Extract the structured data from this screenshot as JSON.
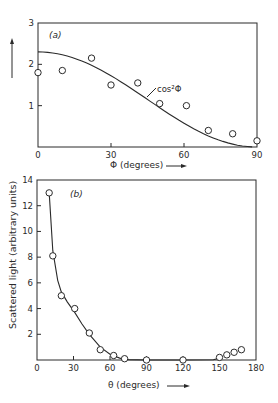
{
  "figure": {
    "ylabel": "Scattered light (arbitrary units)"
  },
  "chart_data": [
    {
      "type": "scatter",
      "panel_label": "(a)",
      "title": "",
      "xlabel": "Φ (degrees)",
      "ylabel": "Scattered light (arbitrary units)",
      "xlim": [
        0,
        90
      ],
      "ylim": [
        0,
        3
      ],
      "xticks": [
        0,
        30,
        60,
        90
      ],
      "yticks": [
        1,
        2,
        3
      ],
      "grid": false,
      "series": [
        {
          "name": "measured",
          "marker": "open-circle",
          "x": [
            0,
            10,
            22,
            30,
            41,
            50,
            61,
            70,
            80,
            90
          ],
          "y": [
            1.8,
            1.85,
            2.15,
            1.5,
            1.55,
            1.05,
            1.0,
            0.4,
            0.32,
            0.15
          ]
        },
        {
          "name": "cos²Φ",
          "style": "line",
          "function": "2.3*cos^2(phi)"
        }
      ],
      "annotations": [
        {
          "text": "cos²Φ",
          "x": 48,
          "y": 1.35
        }
      ]
    },
    {
      "type": "scatter",
      "panel_label": "(b)",
      "title": "",
      "xlabel": "θ (degrees)",
      "ylabel": "Scattered light (arbitrary units)",
      "xlim": [
        0,
        180
      ],
      "ylim": [
        0,
        14
      ],
      "xticks": [
        0,
        30,
        60,
        90,
        120,
        150,
        180
      ],
      "yticks": [
        2,
        4,
        6,
        8,
        10,
        12,
        14
      ],
      "grid": false,
      "series": [
        {
          "name": "measured",
          "marker": "open-circle",
          "x": [
            10,
            13,
            20,
            31,
            43,
            52,
            63,
            72,
            90,
            120,
            150,
            156,
            162,
            168
          ],
          "y": [
            13,
            8.1,
            5,
            4,
            2.1,
            0.8,
            0.35,
            0.1,
            0,
            0,
            0.2,
            0.4,
            0.6,
            0.8
          ]
        },
        {
          "name": "fit",
          "style": "line",
          "x": [
            10,
            13,
            17,
            20,
            25,
            31,
            37,
            43,
            52,
            60,
            68,
            75,
            90,
            120,
            145,
            150
          ],
          "y": [
            13,
            8.5,
            6.2,
            5.3,
            4.5,
            3.7,
            2.8,
            2.0,
            1.0,
            0.45,
            0.15,
            0.03,
            0,
            0,
            0.02,
            0.15
          ]
        }
      ]
    }
  ]
}
